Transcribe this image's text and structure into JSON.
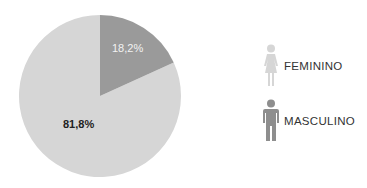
{
  "chart_data": {
    "type": "pie",
    "title": "",
    "categories": [
      "MASCULINO",
      "FEMININO"
    ],
    "values": [
      18.2,
      81.8
    ],
    "labels": [
      "18,2%",
      "81,8%"
    ],
    "colors": [
      "#9a9a9a",
      "#d6d6d6"
    ],
    "start_angle_deg": 0,
    "direction": "clockwise",
    "legend_position": "right"
  },
  "legend": {
    "items": [
      {
        "label": "FEMININO",
        "icon": "female-person-icon",
        "color": "#d6d6d6"
      },
      {
        "label": "MASCULINO",
        "icon": "male-person-icon",
        "color": "#8e8e8e"
      }
    ]
  }
}
